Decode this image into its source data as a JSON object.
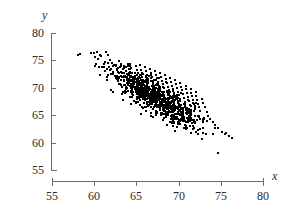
{
  "chart_data": {
    "type": "scatter",
    "title": "",
    "subtitle": "",
    "xlabel": "x",
    "ylabel": "y",
    "xlim": [
      55,
      80
    ],
    "ylim": [
      55,
      80
    ],
    "xticks": [
      55,
      60,
      65,
      70,
      75,
      80
    ],
    "yticks": [
      55,
      60,
      65,
      70,
      75,
      80
    ],
    "xtick_labels": [
      "55",
      "60",
      "65",
      "70",
      "75",
      "80"
    ],
    "ytick_labels": [
      "55",
      "60",
      "65",
      "70",
      "75",
      "80"
    ],
    "grid": false,
    "legend": null,
    "annotations": [],
    "marker": {
      "shape": "dot",
      "size_px": 2,
      "color": "#000000"
    },
    "n_points": 1000,
    "summary": {
      "x_mean": 67.2,
      "y_mean": 68.3,
      "x_sd": 2.6,
      "y_sd": 2.7,
      "correlation": -0.85,
      "x_observed_range": [
        58.0,
        76.2
      ],
      "y_observed_range": [
        58.3,
        76.8
      ],
      "trend": "negative"
    },
    "outliers": [
      {
        "x": 74.6,
        "y": 58.3
      }
    ],
    "points": [
      [
        58.0,
        76.2
      ],
      [
        58.2,
        76.4
      ],
      [
        59.5,
        76.6
      ],
      [
        59.8,
        76.5
      ],
      [
        60.2,
        76.7
      ],
      [
        61.3,
        76.8
      ],
      [
        60.0,
        74.2
      ],
      [
        60.4,
        73.9
      ],
      [
        60.6,
        72.6
      ],
      [
        61.0,
        74.5
      ],
      [
        61.2,
        73.2
      ],
      [
        61.4,
        72.1
      ],
      [
        61.6,
        74.0
      ],
      [
        61.8,
        73.4
      ],
      [
        62.0,
        74.7
      ],
      [
        62.1,
        73.0
      ],
      [
        62.3,
        72.4
      ],
      [
        62.5,
        74.2
      ],
      [
        62.6,
        73.6
      ],
      [
        62.8,
        72.8
      ],
      [
        63.0,
        74.4
      ],
      [
        63.1,
        73.1
      ],
      [
        63.3,
        72.2
      ],
      [
        63.4,
        71.6
      ],
      [
        63.6,
        74.0
      ],
      [
        63.7,
        73.3
      ],
      [
        63.9,
        72.5
      ],
      [
        64.0,
        71.8
      ],
      [
        64.1,
        74.6
      ],
      [
        64.3,
        73.8
      ],
      [
        64.4,
        72.9
      ],
      [
        64.5,
        72.0
      ],
      [
        64.7,
        71.3
      ],
      [
        64.8,
        74.1
      ],
      [
        64.9,
        73.4
      ],
      [
        65.0,
        72.6
      ],
      [
        65.1,
        71.9
      ],
      [
        65.2,
        71.1
      ],
      [
        65.3,
        74.3
      ],
      [
        65.4,
        73.5
      ],
      [
        65.5,
        72.8
      ],
      [
        65.6,
        72.1
      ],
      [
        65.7,
        71.4
      ],
      [
        65.8,
        70.7
      ],
      [
        65.9,
        73.9
      ],
      [
        66.0,
        73.2
      ],
      [
        66.1,
        72.5
      ],
      [
        66.2,
        71.8
      ],
      [
        66.3,
        71.1
      ],
      [
        66.4,
        70.4
      ],
      [
        66.5,
        73.6
      ],
      [
        66.6,
        72.9
      ],
      [
        66.7,
        72.2
      ],
      [
        66.8,
        71.5
      ],
      [
        66.9,
        70.8
      ],
      [
        67.0,
        70.1
      ],
      [
        67.1,
        73.3
      ],
      [
        67.2,
        72.6
      ],
      [
        67.3,
        71.9
      ],
      [
        67.4,
        71.2
      ],
      [
        67.5,
        70.5
      ],
      [
        67.6,
        69.8
      ],
      [
        67.7,
        72.9
      ],
      [
        67.8,
        72.2
      ],
      [
        67.9,
        71.5
      ],
      [
        68.0,
        70.8
      ],
      [
        68.1,
        70.1
      ],
      [
        68.2,
        69.4
      ],
      [
        68.3,
        72.5
      ],
      [
        68.4,
        71.8
      ],
      [
        68.5,
        71.1
      ],
      [
        68.6,
        70.4
      ],
      [
        68.7,
        69.7
      ],
      [
        68.8,
        69.0
      ],
      [
        68.9,
        72.0
      ],
      [
        69.0,
        71.3
      ],
      [
        69.1,
        70.6
      ],
      [
        69.2,
        69.9
      ],
      [
        69.3,
        69.2
      ],
      [
        69.4,
        68.5
      ],
      [
        69.5,
        71.6
      ],
      [
        69.6,
        70.9
      ],
      [
        69.7,
        70.2
      ],
      [
        69.8,
        69.5
      ],
      [
        69.9,
        68.8
      ],
      [
        70.0,
        68.1
      ],
      [
        70.1,
        71.1
      ],
      [
        70.2,
        70.4
      ],
      [
        70.3,
        69.7
      ],
      [
        70.4,
        69.0
      ],
      [
        70.5,
        68.3
      ],
      [
        70.6,
        67.6
      ],
      [
        70.7,
        70.6
      ],
      [
        70.8,
        69.9
      ],
      [
        70.9,
        69.2
      ],
      [
        71.0,
        68.5
      ],
      [
        71.1,
        67.8
      ],
      [
        71.2,
        67.1
      ],
      [
        71.3,
        70.0
      ],
      [
        71.4,
        69.3
      ],
      [
        71.5,
        68.6
      ],
      [
        71.6,
        67.9
      ],
      [
        71.7,
        67.2
      ],
      [
        71.8,
        66.5
      ],
      [
        71.9,
        69.4
      ],
      [
        72.0,
        68.7
      ],
      [
        72.1,
        68.0
      ],
      [
        72.2,
        67.3
      ],
      [
        72.3,
        66.6
      ],
      [
        72.4,
        65.9
      ],
      [
        72.6,
        68.2
      ],
      [
        72.8,
        67.4
      ],
      [
        73.0,
        66.6
      ],
      [
        73.2,
        65.8
      ],
      [
        73.4,
        65.0
      ],
      [
        73.6,
        64.4
      ],
      [
        73.9,
        64.0
      ],
      [
        74.2,
        63.4
      ],
      [
        74.6,
        62.8
      ],
      [
        75.0,
        62.2
      ],
      [
        75.4,
        61.7
      ],
      [
        75.8,
        61.3
      ],
      [
        76.2,
        61.0
      ],
      [
        74.6,
        58.3
      ]
    ]
  },
  "axes": {
    "y_title": "y",
    "x_title": "x"
  }
}
